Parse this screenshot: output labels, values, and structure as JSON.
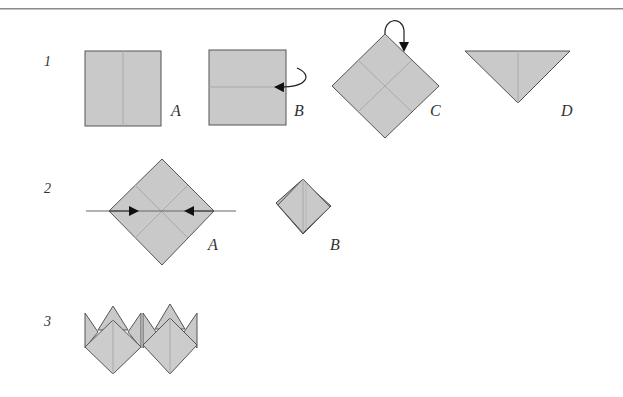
{
  "colors": {
    "paper_fill": "#c9c9c9",
    "outline": "#555555",
    "crease": "#a9a9a9",
    "arrow": "#111111",
    "rule": "#8a8a8a"
  },
  "steps": [
    {
      "number": "1",
      "figures": [
        {
          "label": "A",
          "description": "square with vertical center crease"
        },
        {
          "label": "B",
          "description": "square with horizontal crease and fold-behind arrow"
        },
        {
          "label": "C",
          "description": "diamond with diagonal creases and fold arrow from top corner"
        },
        {
          "label": "D",
          "description": "inverted triangle with vertical crease"
        }
      ]
    },
    {
      "number": "2",
      "figures": [
        {
          "label": "A",
          "description": "diamond with creases and inward squash arrows"
        },
        {
          "label": "B",
          "description": "collapsed square base"
        }
      ]
    },
    {
      "number": "3",
      "figures": [
        {
          "label": "",
          "description": "two tulip shapes side by side"
        }
      ]
    }
  ]
}
